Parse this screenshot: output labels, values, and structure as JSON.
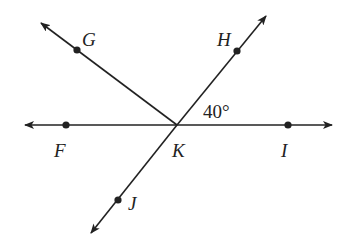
{
  "diagram": {
    "type": "geometry-angles",
    "vertex": {
      "name": "K",
      "x": 177,
      "y": 125
    },
    "points": {
      "F": {
        "label": "F",
        "x": 66,
        "y": 125
      },
      "I": {
        "label": "I",
        "x": 288,
        "y": 125
      },
      "G": {
        "label": "G",
        "x": 77,
        "y": 50
      },
      "H": {
        "label": "H",
        "x": 237,
        "y": 51
      },
      "J": {
        "label": "J",
        "x": 118,
        "y": 200
      }
    },
    "lines": [
      {
        "name": "line-FI",
        "from": [
          25,
          125
        ],
        "to": [
          332,
          125
        ],
        "arrows": "both"
      },
      {
        "name": "line-HJ",
        "from": [
          91,
          233
        ],
        "to": [
          266,
          16
        ],
        "arrows": "both"
      },
      {
        "name": "ray-KG",
        "from": [
          177,
          125
        ],
        "to": [
          41,
          23
        ],
        "arrows": "end"
      }
    ],
    "angle_label": {
      "text": "40°",
      "between": [
        "H",
        "I"
      ]
    },
    "stroke_color": "#222222"
  }
}
